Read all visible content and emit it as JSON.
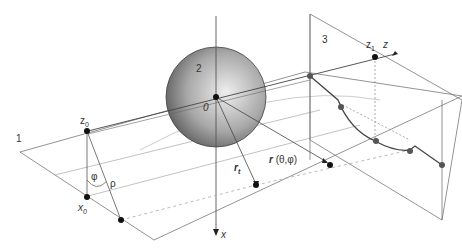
{
  "diagram": {
    "regions": {
      "plane_1": "1",
      "sphere_2": "2",
      "plane_3": "3"
    },
    "origin": "0",
    "axes": {
      "x": "x",
      "z": "z"
    },
    "points": {
      "z0": {
        "base": "z",
        "sub": "0"
      },
      "x0": {
        "base": "x",
        "sub": "0"
      },
      "z1": {
        "base": "z",
        "sub": "1"
      }
    },
    "angles": {
      "phi": "φ",
      "rho": "ρ"
    },
    "vectors": {
      "r_t": {
        "base": "r",
        "sub": "t"
      },
      "r_theta_phi": {
        "base": "r",
        "args": "(θ,φ)"
      }
    },
    "colors": {
      "line": "#555555",
      "sphere_light": "#e6e6e6",
      "sphere_dark": "#6a6a6a",
      "dashed": "#aaaaaa",
      "point": "#111111",
      "curve": "#444444"
    }
  }
}
